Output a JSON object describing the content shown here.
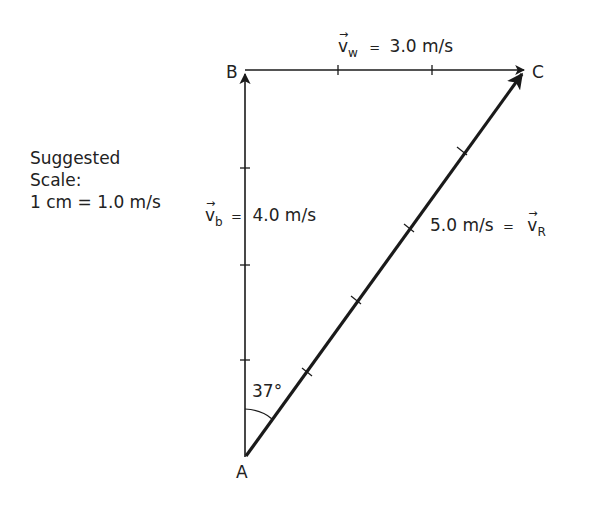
{
  "diagram": {
    "type": "vector-addition-triangle",
    "points": {
      "A": {
        "label": "A",
        "x": 245,
        "y": 457
      },
      "B": {
        "label": "B",
        "x": 245,
        "y": 70
      },
      "C": {
        "label": "C",
        "x": 525,
        "y": 70
      }
    },
    "vectors": {
      "boat": {
        "symbol": "v",
        "subscript": "b",
        "equals": "=",
        "value": "4.0 m/s",
        "from": "A",
        "to": "B"
      },
      "water": {
        "symbol": "v",
        "subscript": "w",
        "equals": "=",
        "value": "3.0 m/s",
        "from": "B",
        "to": "C"
      },
      "resultant": {
        "symbol": "v",
        "subscript": "R",
        "equals": "=",
        "value": "5.0 m/s",
        "from": "A",
        "to": "C"
      }
    },
    "angle": {
      "label": "37°",
      "vertex": "A"
    },
    "scale_note": {
      "line1": "Suggested",
      "line2": "Scale:",
      "line3": "1 cm = 1.0 m/s"
    },
    "colors": {
      "line": "#1a1a1a",
      "text": "#222222",
      "background": "#ffffff"
    }
  }
}
